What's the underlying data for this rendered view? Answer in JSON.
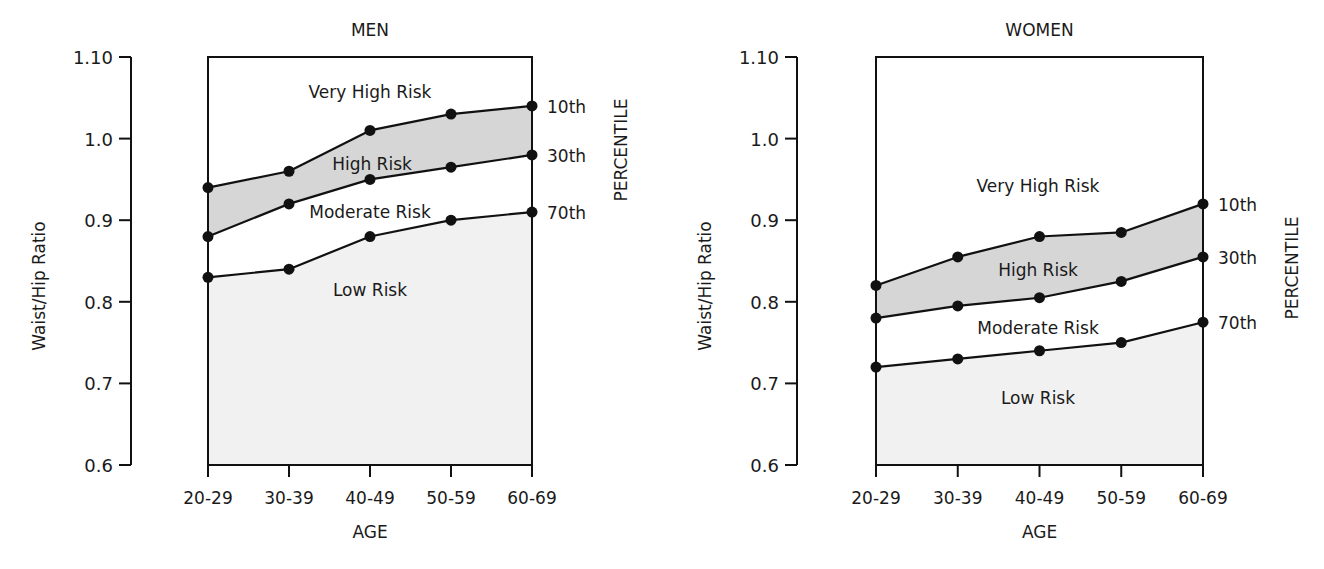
{
  "chart_data": [
    {
      "type": "area",
      "title": "MEN",
      "xlabel": "AGE",
      "ylabel": "Waist/Hip Ratio",
      "right_label": "PERCENTILE",
      "categories": [
        "20-29",
        "30-39",
        "40-49",
        "50-59",
        "60-69"
      ],
      "ylim": [
        0.6,
        1.1
      ],
      "yticks": [
        "1.10",
        "1.0",
        "0.9",
        "0.8",
        "0.7",
        "0.6"
      ],
      "ytick_values": [
        1.1,
        1.0,
        0.9,
        0.8,
        0.7,
        0.6
      ],
      "grid": false,
      "series": [
        {
          "name": "10th",
          "values": [
            0.94,
            0.96,
            1.01,
            1.03,
            1.04
          ]
        },
        {
          "name": "30th",
          "values": [
            0.88,
            0.92,
            0.95,
            0.965,
            0.98
          ]
        },
        {
          "name": "70th",
          "values": [
            0.83,
            0.84,
            0.88,
            0.9,
            0.91
          ]
        }
      ],
      "regions": [
        {
          "label": "Very High Risk",
          "x": 370,
          "y": 98
        },
        {
          "label": "High Risk",
          "x": 372,
          "y": 170
        },
        {
          "label": "Moderate Risk",
          "x": 370,
          "y": 218
        },
        {
          "label": "Low Risk",
          "x": 370,
          "y": 296
        }
      ],
      "layout": {
        "axis_x": 131,
        "box_left": 208,
        "box_right": 532,
        "top": 57,
        "bottom": 465,
        "tick_left": 119
      }
    },
    {
      "type": "area",
      "title": "WOMEN",
      "xlabel": "AGE",
      "ylabel": "Waist/Hip Ratio",
      "right_label": "PERCENTILE",
      "categories": [
        "20-29",
        "30-39",
        "40-49",
        "50-59",
        "60-69"
      ],
      "ylim": [
        0.6,
        1.1
      ],
      "yticks": [
        "1.10",
        "1.0",
        "0.9",
        "0.8",
        "0.7",
        "0.6"
      ],
      "ytick_values": [
        1.1,
        1.0,
        0.9,
        0.8,
        0.7,
        0.6
      ],
      "grid": false,
      "series": [
        {
          "name": "10th",
          "values": [
            0.82,
            0.855,
            0.88,
            0.885,
            0.92
          ]
        },
        {
          "name": "30th",
          "values": [
            0.78,
            0.795,
            0.805,
            0.825,
            0.855
          ]
        },
        {
          "name": "70th",
          "values": [
            0.72,
            0.73,
            0.74,
            0.75,
            0.775
          ]
        }
      ],
      "regions": [
        {
          "label": "Very High Risk",
          "x": 1038,
          "y": 192
        },
        {
          "label": "High Risk",
          "x": 1038,
          "y": 276
        },
        {
          "label": "Moderate Risk",
          "x": 1038,
          "y": 334
        },
        {
          "label": "Low Risk",
          "x": 1038,
          "y": 404
        }
      ],
      "layout": {
        "axis_x": 797,
        "box_left": 876,
        "box_right": 1203,
        "top": 57,
        "bottom": 465,
        "tick_left": 785
      }
    }
  ],
  "colors": {
    "line": "#111111",
    "high_risk_fill": "#d6d6d6",
    "low_risk_fill": "#f1f1f1",
    "background": "#ffffff"
  }
}
